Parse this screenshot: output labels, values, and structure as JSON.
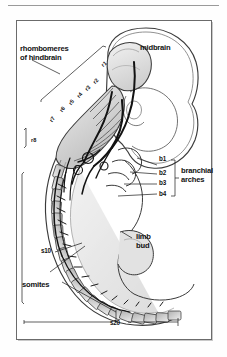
{
  "figure": {
    "type": "anatomical-diagram",
    "border_color": "#6b6b6b",
    "background_color": "#ffffff",
    "ink_color": "#111111"
  },
  "labels": {
    "rhombomeres_title": "rhombomeres\nof hindbrain",
    "midbrain": "midbrain",
    "branchial_arches": "branchial\narches",
    "limb_bud": "limb\nbud",
    "somites": "somites",
    "somite_10": "s10",
    "somite_20": "s20"
  },
  "rhombomeres": [
    {
      "id": "r1",
      "label": "r1"
    },
    {
      "id": "r2",
      "label": "r2"
    },
    {
      "id": "r3",
      "label": "r3"
    },
    {
      "id": "r4",
      "label": "r4"
    },
    {
      "id": "r5",
      "label": "r5"
    },
    {
      "id": "r6",
      "label": "r6"
    },
    {
      "id": "r7",
      "label": "r7"
    },
    {
      "id": "r8",
      "label": "r8"
    }
  ],
  "branchial_arches": [
    {
      "id": "b1",
      "label": "b1"
    },
    {
      "id": "b2",
      "label": "b2"
    },
    {
      "id": "b3",
      "label": "b3"
    },
    {
      "id": "b4",
      "label": "b4"
    }
  ]
}
